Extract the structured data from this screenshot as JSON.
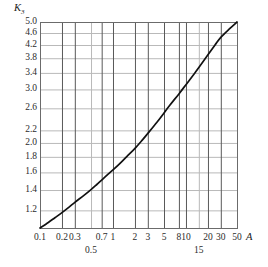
{
  "chart_data": {
    "type": "line",
    "title": "",
    "subtitle": "",
    "xlabel": "A",
    "ylabel": "K3",
    "ylabel_display": "K",
    "ylabel_sub": "3",
    "xscale": "log",
    "yscale": "log",
    "xlim": [
      0.1,
      50
    ],
    "ylim": [
      1.05,
      5.0
    ],
    "grid": true,
    "legend": null,
    "xticks": [
      {
        "value": 0.1,
        "label": "0.1",
        "row": 0
      },
      {
        "value": 0.2,
        "label": "0.2",
        "row": 0
      },
      {
        "value": 0.3,
        "label": "0.3",
        "row": 0
      },
      {
        "value": 0.5,
        "label": "0.5",
        "row": 1
      },
      {
        "value": 0.7,
        "label": "0.7",
        "row": 0
      },
      {
        "value": 1,
        "label": "1",
        "row": 0
      },
      {
        "value": 2,
        "label": "2",
        "row": 0
      },
      {
        "value": 3,
        "label": "3",
        "row": 0
      },
      {
        "value": 5,
        "label": "5",
        "row": 0
      },
      {
        "value": 8,
        "label": "8",
        "row": 0
      },
      {
        "value": 10,
        "label": "10",
        "row": 0
      },
      {
        "value": 15,
        "label": "15",
        "row": 1
      },
      {
        "value": 20,
        "label": "20",
        "row": 0
      },
      {
        "value": 30,
        "label": "30",
        "row": 0
      },
      {
        "value": 50,
        "label": "50",
        "row": 0
      }
    ],
    "yticks": [
      {
        "value": 5.0,
        "label": "5.0"
      },
      {
        "value": 4.6,
        "label": "4.6"
      },
      {
        "value": 4.2,
        "label": "4.2"
      },
      {
        "value": 3.8,
        "label": "3.8"
      },
      {
        "value": 3.4,
        "label": "3.4"
      },
      {
        "value": 3.0,
        "label": "3.0"
      },
      {
        "value": 2.6,
        "label": "2.6"
      },
      {
        "value": 2.2,
        "label": "2.2"
      },
      {
        "value": 2.0,
        "label": "2.0"
      },
      {
        "value": 1.8,
        "label": "1.8"
      },
      {
        "value": 1.6,
        "label": "1.6"
      },
      {
        "value": 1.4,
        "label": "1.4"
      },
      {
        "value": 1.2,
        "label": "1.2"
      }
    ],
    "series": [
      {
        "name": "K3(A)",
        "points": [
          [
            0.1,
            1.05
          ],
          [
            0.13,
            1.095
          ],
          [
            0.16,
            1.135
          ],
          [
            0.2,
            1.18
          ],
          [
            0.25,
            1.23
          ],
          [
            0.3,
            1.275
          ],
          [
            0.4,
            1.345
          ],
          [
            0.5,
            1.405
          ],
          [
            0.6,
            1.46
          ],
          [
            0.7,
            1.51
          ],
          [
            0.85,
            1.575
          ],
          [
            1.0,
            1.63
          ],
          [
            1.3,
            1.73
          ],
          [
            1.6,
            1.82
          ],
          [
            2.0,
            1.92
          ],
          [
            2.5,
            2.04
          ],
          [
            3.0,
            2.15
          ],
          [
            4.0,
            2.34
          ],
          [
            5.0,
            2.51
          ],
          [
            6.0,
            2.66
          ],
          [
            8.0,
            2.9
          ],
          [
            10.0,
            3.11
          ],
          [
            13.0,
            3.38
          ],
          [
            15.0,
            3.54
          ],
          [
            20.0,
            3.9
          ],
          [
            25.0,
            4.2
          ],
          [
            30.0,
            4.45
          ],
          [
            40.0,
            4.76
          ],
          [
            50.0,
            5.0
          ]
        ]
      }
    ],
    "colors": {
      "curve": "#111111",
      "vgrid": "#595959",
      "hgrid": "#b9b9b9",
      "frame": "#6b6b6b",
      "text": "#2b2b2b"
    }
  },
  "plot_geometry": {
    "left": 40,
    "right": 237,
    "top": 22,
    "bottom": 228
  }
}
